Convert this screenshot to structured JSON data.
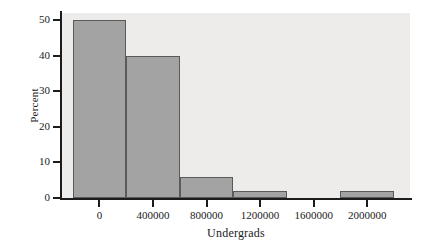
{
  "chart_data": {
    "type": "bar",
    "title": "",
    "subtitle": "",
    "xlabel": "Undergrads",
    "ylabel": "Percent",
    "grid": false,
    "legend": false,
    "legend_position": "none",
    "histogram": true,
    "bin_width": 400000,
    "bin_edges": [
      -200000,
      200000,
      600000,
      1000000,
      1400000,
      1800000,
      2200000
    ],
    "bin_centers": [
      0,
      400000,
      800000,
      1200000,
      1600000,
      2000000
    ],
    "categories": [
      "0",
      "400000",
      "800000",
      "1200000",
      "1600000",
      "2000000"
    ],
    "values": [
      50,
      40,
      6,
      2,
      0,
      2
    ],
    "xlim": [
      -280000,
      2320000
    ],
    "ylim": [
      0,
      52
    ],
    "xticks": [
      0,
      400000,
      800000,
      1200000,
      1600000,
      2000000
    ],
    "xtick_labels": [
      "0",
      "400000",
      "800000",
      "1200000",
      "1600000",
      "2000000"
    ],
    "yticks": [
      0,
      10,
      20,
      30,
      40,
      50
    ],
    "ytick_labels": [
      "0",
      "10",
      "20",
      "30",
      "40",
      "50"
    ],
    "bar_fill_color": "#a3a3a3",
    "bar_edge_color": "#5a5a5a",
    "panel_background_color": "#edecea",
    "axis_color": "#1c1c1c",
    "figure_background_color": "#ffffff"
  }
}
